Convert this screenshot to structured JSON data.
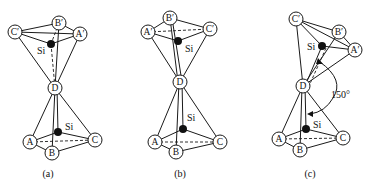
{
  "panels": [
    {
      "caption": "(a)",
      "atoms": {
        "A": "A",
        "B": "B",
        "C": "C",
        "D": "D",
        "A1": "A′",
        "B1": "B′",
        "C1": "C′"
      },
      "si_upper": "Si",
      "si_lower": "Si"
    },
    {
      "caption": "(b)",
      "atoms": {
        "A": "A",
        "B": "B",
        "C": "C",
        "D": "D",
        "A1": "A′",
        "B1": "B′",
        "C1": "C′"
      },
      "si_upper": "Si",
      "si_lower": "Si"
    },
    {
      "caption": "(c)",
      "atoms": {
        "A": "A",
        "B": "B",
        "C": "C",
        "D": "D",
        "A1": "A′",
        "B1": "B′",
        "C1": "C′"
      },
      "si_upper": "Si",
      "si_lower": "Si",
      "angle_label": "150°"
    }
  ]
}
